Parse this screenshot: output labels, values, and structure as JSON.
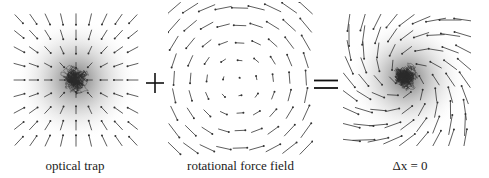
{
  "figure": {
    "panels": [
      {
        "id": "optical-trap",
        "label": "optical trap",
        "field_type": "radial-inward",
        "has_trajectory": true,
        "has_gaussian_shading": true
      },
      {
        "id": "rotational-force-field",
        "label": "rotational force field",
        "field_type": "rotational-counterclockwise",
        "has_trajectory": false,
        "has_gaussian_shading": false
      },
      {
        "id": "combined",
        "label": "Δx = 0",
        "field_type": "spiral-inward",
        "has_trajectory": true,
        "has_gaussian_shading": true
      }
    ],
    "operators": {
      "plus": "+",
      "equals": "="
    },
    "colors": {
      "arrow": "#333333",
      "trajectory": "#2a2a2a",
      "shading_center": "#6e6e6e",
      "background": "#ffffff"
    }
  }
}
